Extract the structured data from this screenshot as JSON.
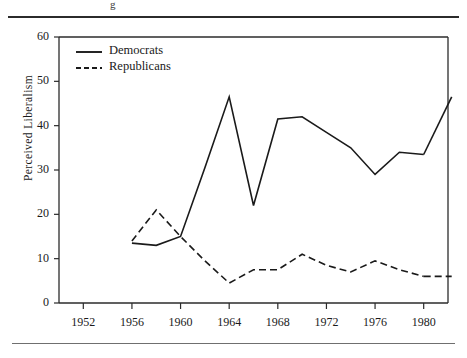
{
  "figure": {
    "top_rule": "horizontal-rule",
    "bottom_rule": "horizontal-rule",
    "cropped_caption_fragment": "g"
  },
  "chart_data": {
    "type": "line",
    "title": "",
    "xlabel": "",
    "ylabel": "Perceived  Liberalism",
    "xlim": [
      1950,
      1982
    ],
    "ylim": [
      0,
      60
    ],
    "grid": false,
    "legend_position": "top-left-inside",
    "xticks": [
      1952,
      1956,
      1960,
      1964,
      1968,
      1972,
      1976,
      1980
    ],
    "xtick_labels": [
      "1952",
      "1956",
      "1960",
      "1964",
      "1968",
      "1972",
      "1976",
      "1980"
    ],
    "yticks": [
      0,
      10,
      20,
      30,
      40,
      50,
      60
    ],
    "ytick_labels": [
      "0",
      "10",
      "20",
      "30",
      "40",
      "50",
      "60"
    ],
    "x": [
      1956,
      1958,
      1960,
      1962,
      1964,
      1966,
      1968,
      1970,
      1972,
      1974,
      1976,
      1978,
      1980
    ],
    "series": [
      {
        "name": "Democrats",
        "style": "solid",
        "color": "#1a1a1a",
        "values": [
          13.5,
          13.0,
          15.0,
          30.5,
          46.5,
          22.0,
          41.5,
          42.0,
          38.5,
          35.0,
          29.0,
          34.0,
          33.5
        ]
      },
      {
        "name": "Republicans",
        "style": "dashed",
        "color": "#1a1a1a",
        "values": [
          14.0,
          21.0,
          15.0,
          9.5,
          4.5,
          7.5,
          7.5,
          11.0,
          8.5,
          7.0,
          9.5,
          7.5,
          6.0
        ]
      }
    ],
    "series_extra_point": {
      "note": "Democrats final segment rises to 1980 endpoint",
      "democrats_1980": 46.5
    },
    "legend": [
      {
        "label": "Democrats",
        "style": "solid"
      },
      {
        "label": "Republicans",
        "style": "dashed"
      }
    ]
  }
}
